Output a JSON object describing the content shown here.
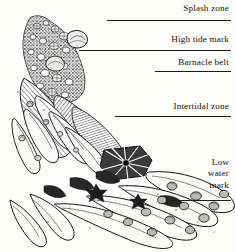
{
  "figure": {
    "style": "pen-and-ink engraving",
    "background_color": "#fefefc",
    "ink_color": "#1a1a1a",
    "width": 235,
    "height": 252
  },
  "zones": [
    {
      "id": "splash",
      "label": "Splash zone",
      "rule": true
    },
    {
      "id": "high",
      "label": "High tide mark",
      "rule": true
    },
    {
      "id": "barnacle",
      "label": "Barnacle belt",
      "rule": true
    },
    {
      "id": "inter",
      "label": "Intertidal zone",
      "rule": true
    },
    {
      "id": "low",
      "label": "Low\nwater\nmark",
      "rule": true
    }
  ],
  "illustration": {
    "name": "shore-life-cross-section",
    "subjects": [
      "barnacle-encrusted rock",
      "limpets",
      "periwinkle snails",
      "seaweed fronds",
      "kelp blades",
      "sea anemone",
      "mussel bed",
      "sea stars"
    ]
  }
}
